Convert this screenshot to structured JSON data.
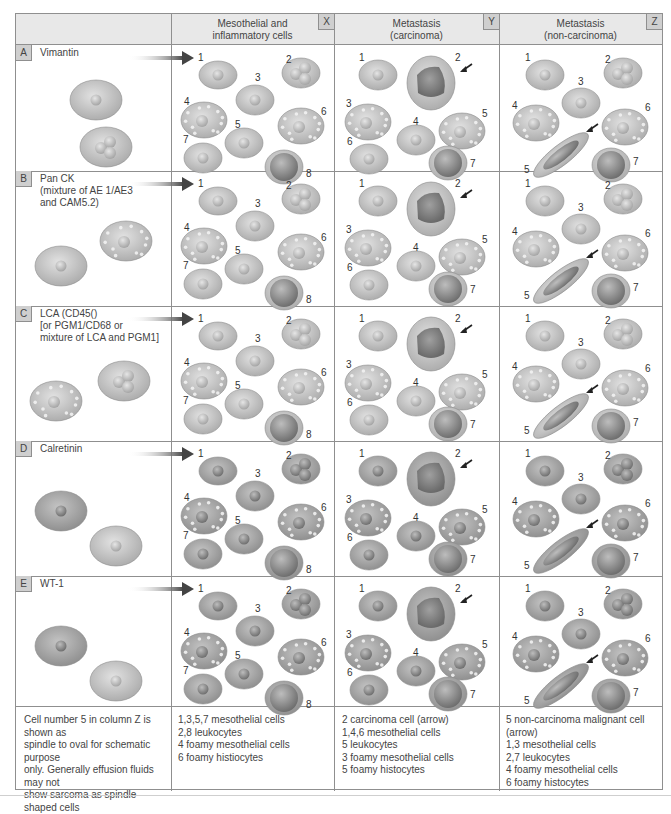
{
  "columns": [
    {
      "badge": "X",
      "title_line1": "Mesothelial and",
      "title_line2": "inflammatory cells"
    },
    {
      "badge": "Y",
      "title_line1": "Metastasis",
      "title_line2": "(carcinoma)"
    },
    {
      "badge": "Z",
      "title_line1": "Metastasis",
      "title_line2": "(non-carcinoma)"
    }
  ],
  "rows": [
    {
      "letter": "A",
      "name": "Vimantin"
    },
    {
      "letter": "B",
      "name": "Pan CK\n(mixture of AE 1/AE3\nand CAM5.2)"
    },
    {
      "letter": "C",
      "name": "LCA (CD45()\n[or PGM1/CD68 or\nmixture of LCA and PGM1]"
    },
    {
      "letter": "D",
      "name": "Calretinin"
    },
    {
      "letter": "E",
      "name": "WT-1"
    }
  ],
  "cell_labels": {
    "X": [
      "1",
      "2",
      "3",
      "4",
      "5",
      "6",
      "7",
      "8"
    ],
    "Y": [
      "1",
      "2",
      "3",
      "4",
      "5",
      "6",
      "7"
    ],
    "Z": [
      "1",
      "2",
      "3",
      "4",
      "5",
      "6",
      "7"
    ]
  },
  "footer": {
    "note": "Cell number 5 in column Z is shown as\nspindle to oval for schematic purpose\nonly. Generally effusion fluids may not\nshow sarcoma as spindle shaped cells",
    "legend_X": "1,3,5,7 mesothelial cells\n2,8 leukocytes\n4 foamy mesothelial cells\n6 foamy histiocytes",
    "legend_Y": "2 carcinoma cell (arrow)\n1,4,6 mesothelial cells\n5 leukocytes\n3 foamy mesothelial cells\n5 foamy histocytes",
    "legend_Z": "5 non-carcinoma malignant cell (arrow)\n1,3 mesothelial cells\n2,7 leukocytes\n4 foamy mesothelial cells\n6 foamy histocytes"
  },
  "colors": {
    "header_bg": "#e8e8e8",
    "badge_bg": "#cfcfcf",
    "cell_cytoplasm": "#c9c9c9",
    "cell_nucleus": "#8a8a8a",
    "stained_cytoplasm": "#a6a6a6",
    "arrow": "#333333"
  }
}
